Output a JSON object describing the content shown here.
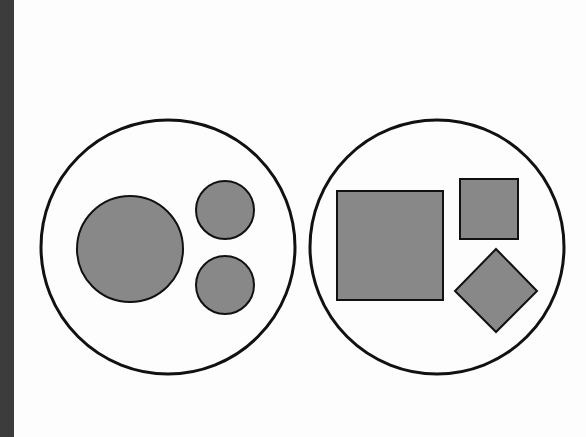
{
  "colors": {
    "background": "#fdfdfd",
    "left_bar": "#3c3c3c",
    "shape_fill": "#888888",
    "stroke": "#111111"
  },
  "groups": [
    {
      "name": "circles-group",
      "container": {
        "cx": 168,
        "cy": 247,
        "r": 127
      },
      "shapes": [
        {
          "type": "circle",
          "name": "large-circle",
          "cx": 130,
          "cy": 249,
          "r": 53
        },
        {
          "type": "circle",
          "name": "small-circle-top",
          "cx": 225,
          "cy": 210,
          "r": 29
        },
        {
          "type": "circle",
          "name": "small-circle-bottom",
          "cx": 225,
          "cy": 285,
          "r": 29
        }
      ]
    },
    {
      "name": "squares-group",
      "container": {
        "cx": 437,
        "cy": 247,
        "r": 127
      },
      "shapes": [
        {
          "type": "rect",
          "name": "large-square",
          "x": 337,
          "y": 191,
          "w": 106,
          "h": 109
        },
        {
          "type": "rect",
          "name": "small-square",
          "x": 460,
          "y": 179,
          "w": 58,
          "h": 60
        },
        {
          "type": "diamond",
          "name": "diamond",
          "points": "496,249 537,291 496,332 455,291"
        }
      ]
    }
  ]
}
